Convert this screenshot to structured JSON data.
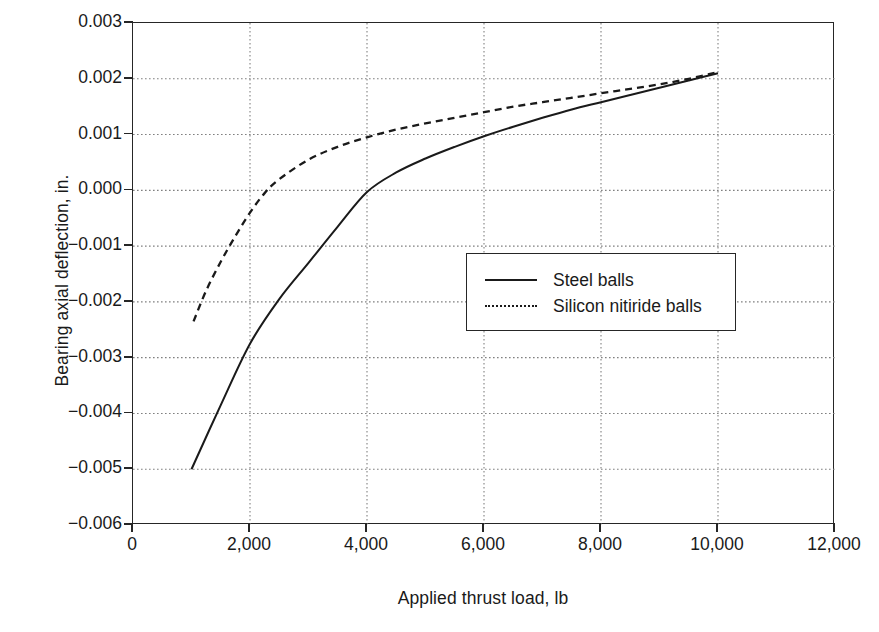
{
  "chart_data": {
    "type": "line",
    "title": "",
    "xlabel": "Applied thrust load, lb",
    "ylabel": "Bearing axial deflection, in.",
    "xlim": [
      0,
      12000
    ],
    "ylim": [
      -0.006,
      0.003
    ],
    "xticks": [
      0,
      2000,
      4000,
      6000,
      8000,
      10000,
      12000
    ],
    "xtick_labels": [
      "0",
      "2,000",
      "4,000",
      "6,000",
      "8,000",
      "10,000",
      "12,000"
    ],
    "yticks": [
      0.003,
      0.002,
      0.001,
      0.0,
      -0.001,
      -0.002,
      -0.003,
      -0.004,
      -0.005,
      -0.006
    ],
    "ytick_labels": [
      "0.003",
      "0.002",
      "0.001",
      "0.000",
      "−0.001",
      "−0.002",
      "−0.003",
      "−0.004",
      "−0.005",
      "−0.006"
    ],
    "grid": true,
    "grid_style": "dotted",
    "legend_position": "center-right",
    "series": [
      {
        "name": "Steel balls",
        "style": "solid",
        "color": "#1a1a1a",
        "x": [
          1000,
          1500,
          2000,
          2500,
          3000,
          3500,
          4000,
          4500,
          5000,
          5500,
          6000,
          6500,
          7000,
          7500,
          8000,
          8500,
          9000,
          9500,
          10000
        ],
        "y": [
          -0.005,
          -0.00385,
          -0.00275,
          -0.00195,
          -0.0013,
          -0.00065,
          -3e-05,
          0.00032,
          0.00057,
          0.00078,
          0.00097,
          0.00114,
          0.0013,
          0.00145,
          0.00158,
          0.00171,
          0.00184,
          0.00197,
          0.0021
        ]
      },
      {
        "name": "Silicon nitiride balls",
        "style": "dotted",
        "color": "#1a1a1a",
        "x": [
          1035,
          1250,
          1500,
          1750,
          2000,
          2250,
          2500,
          3000,
          3500,
          4000,
          4500,
          5000,
          5500,
          6000,
          6500,
          7000,
          7500,
          8000,
          8500,
          9000,
          9500,
          10000
        ],
        "y": [
          -0.00235,
          -0.0018,
          -0.00128,
          -0.00082,
          -0.0004,
          -5e-05,
          0.0002,
          0.00055,
          0.00078,
          0.00095,
          0.00109,
          0.0012,
          0.0013,
          0.0014,
          0.0015,
          0.00158,
          0.00166,
          0.00174,
          0.00182,
          0.0019,
          0.002,
          0.00212
        ]
      }
    ]
  },
  "legend": {
    "items": [
      {
        "label": "Steel balls",
        "style": "solid"
      },
      {
        "label": "Silicon nitiride balls",
        "style": "dotted"
      }
    ]
  },
  "axes": {
    "x_title": "Applied thrust load, lb",
    "y_title": "Bearing axial deflection, in."
  },
  "bottom_fragment": ""
}
